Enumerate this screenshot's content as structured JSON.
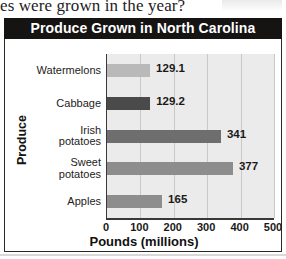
{
  "page": {
    "partial_text_above": "es were grown in the year?"
  },
  "chart": {
    "title": "Produce Grown in North Carolina",
    "x_axis_title": "Pounds (millions)",
    "y_axis_title": "Produce"
  },
  "chart_data": {
    "type": "bar",
    "orientation": "horizontal",
    "title": "Produce Grown in North Carolina",
    "xlabel": "Pounds (millions)",
    "ylabel": "Produce",
    "categories": [
      "Watermelons",
      "Cabbage",
      "Irish potatoes",
      "Sweet potatoes",
      "Apples"
    ],
    "values": [
      129.1,
      129.2,
      341,
      377,
      165
    ],
    "value_labels": [
      "129.1",
      "129.2",
      "341",
      "377",
      "165"
    ],
    "bar_colors": [
      "#b9b9b9",
      "#4a4a4a",
      "#6e6e6e",
      "#8d8d8d",
      "#8d8d8d"
    ],
    "category_label_lines": [
      [
        "Watermelons"
      ],
      [
        "Cabbage"
      ],
      [
        "Irish",
        "potatoes"
      ],
      [
        "Sweet",
        "potatoes"
      ],
      [
        "Apples"
      ]
    ],
    "xlim": [
      0,
      500
    ],
    "xticks": [
      0,
      100,
      200,
      300,
      400,
      500
    ],
    "xtick_labels": [
      "0",
      "100",
      "200",
      "300",
      "400",
      "500"
    ],
    "grid": true,
    "legend": "none",
    "plot_background": "#ebebeb",
    "title_background": "#151413",
    "title_color": "#ffffff"
  }
}
